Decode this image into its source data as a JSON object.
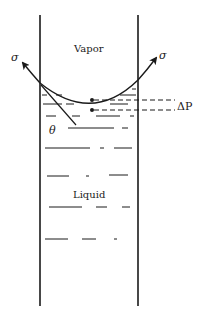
{
  "diagram": {
    "labels": {
      "vapor": "Vapor",
      "liquid": "Liquid",
      "sigma_left": "σ",
      "sigma_right": "σ",
      "theta": "θ",
      "delta_p": "ΔP"
    },
    "colors": {
      "ink": "#1a1a1a",
      "background": "#ffffff"
    }
  }
}
